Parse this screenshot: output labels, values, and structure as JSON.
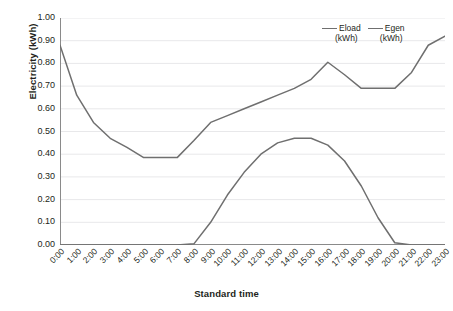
{
  "chart_data": {
    "type": "line",
    "title": "",
    "xlabel": "Standard time",
    "ylabel": "Electricity  (kWh)",
    "x": [
      "0:00",
      "1:00",
      "2:00",
      "3:00",
      "4:00",
      "5:00",
      "6:00",
      "7:00",
      "8:00",
      "9:00",
      "10:00",
      "11:00",
      "12:00",
      "13:00",
      "14:00",
      "15:00",
      "16:00",
      "17:00",
      "18:00",
      "19:00",
      "20:00",
      "21:00",
      "22:00",
      "23:00"
    ],
    "series": [
      {
        "name": "Eload",
        "unit": "(kWh)",
        "color": "#6f6f6f",
        "values": [
          0.88,
          0.66,
          0.54,
          0.47,
          0.43,
          0.385,
          0.385,
          0.385,
          0.46,
          0.54,
          0.57,
          0.6,
          0.63,
          0.66,
          0.69,
          0.73,
          0.805,
          0.75,
          0.69,
          0.69,
          0.69,
          0.76,
          0.88,
          0.92
        ]
      },
      {
        "name": "Egen",
        "unit": "(kWh)",
        "color": "#6f6f6f",
        "values": [
          0.0,
          0.0,
          0.0,
          0.0,
          0.0,
          0.0,
          0.0,
          0.0,
          0.005,
          0.1,
          0.22,
          0.32,
          0.4,
          0.45,
          0.47,
          0.47,
          0.44,
          0.37,
          0.26,
          0.12,
          0.01,
          0.0,
          0.0,
          0.0
        ]
      }
    ],
    "ylim": [
      0.0,
      1.0
    ],
    "ytick_step": 0.1,
    "ytick_labels": [
      "1.00",
      "0.90",
      "0.80",
      "0.70",
      "0.60",
      "0.50",
      "0.40",
      "0.30",
      "0.20",
      "0.10",
      "0.00"
    ],
    "grid": true,
    "grid_axis": "y",
    "grid_color": "#e8e8ea",
    "axis_color": "#8a8a8a",
    "legend_position": "top-right"
  }
}
